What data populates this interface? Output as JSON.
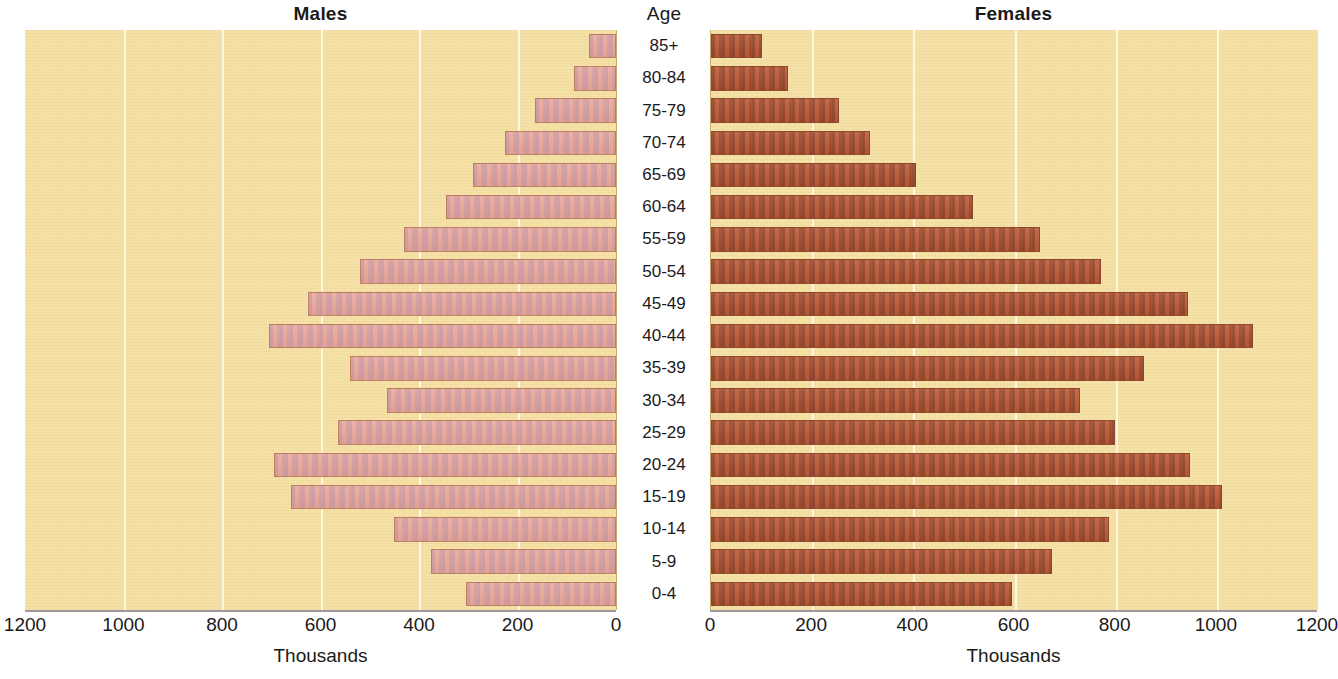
{
  "chart_data": {
    "type": "bar",
    "chart_kind": "population-pyramid",
    "title": "",
    "categories": [
      "85+",
      "80-84",
      "75-79",
      "70-74",
      "65-69",
      "60-64",
      "55-59",
      "50-54",
      "45-49",
      "40-44",
      "35-39",
      "30-34",
      "25-29",
      "20-24",
      "15-19",
      "10-14",
      "5-9",
      "0-4"
    ],
    "category_axis_label": "Age",
    "series": [
      {
        "name": "Males",
        "side": "left",
        "values": [
          55,
          85,
          165,
          225,
          290,
          345,
          430,
          520,
          625,
          705,
          540,
          465,
          565,
          695,
          660,
          450,
          375,
          305
        ]
      },
      {
        "name": "Females",
        "side": "right",
        "values": [
          100,
          152,
          254,
          315,
          406,
          517,
          650,
          771,
          943,
          1071,
          857,
          729,
          798,
          946,
          1010,
          787,
          675,
          596
        ]
      }
    ],
    "xlabel": "Thousands",
    "ylabel": "Age",
    "xlim_left": [
      1200,
      0
    ],
    "xlim_right": [
      0,
      1200
    ],
    "xticks_left": [
      "1200",
      "1000",
      "800",
      "600",
      "400",
      "200",
      "0"
    ],
    "xticks_right": [
      "0",
      "200",
      "400",
      "600",
      "800",
      "1000",
      "1200"
    ],
    "tick_values": [
      0,
      200,
      400,
      600,
      800,
      1000,
      1200
    ],
    "grid": true,
    "gridlines_at": [
      200,
      400,
      600,
      800,
      1000
    ],
    "legend": "none",
    "units": "Thousands"
  },
  "panels": {
    "males": {
      "title": "Males",
      "caption": "Thousands",
      "ticks": [
        "1200",
        "1000",
        "800",
        "600",
        "400",
        "200",
        "0"
      ]
    },
    "females": {
      "title": "Females",
      "caption": "Thousands",
      "ticks": [
        "0",
        "200",
        "400",
        "600",
        "800",
        "1000",
        "1200"
      ]
    },
    "age": {
      "title": "Age",
      "labels": [
        "85+",
        "80-84",
        "75-79",
        "70-74",
        "65-69",
        "60-64",
        "55-59",
        "50-54",
        "45-49",
        "40-44",
        "35-39",
        "30-34",
        "25-29",
        "20-24",
        "15-19",
        "10-14",
        "5-9",
        "0-4"
      ]
    }
  },
  "colors": {
    "plot_background": "#f5e0a3",
    "gridline": "#fdf6e0",
    "male_bar": "#e8a79a",
    "female_bar": "#b85a36",
    "text": "#1a1a1a",
    "axis_line": "#9a9a9a"
  }
}
